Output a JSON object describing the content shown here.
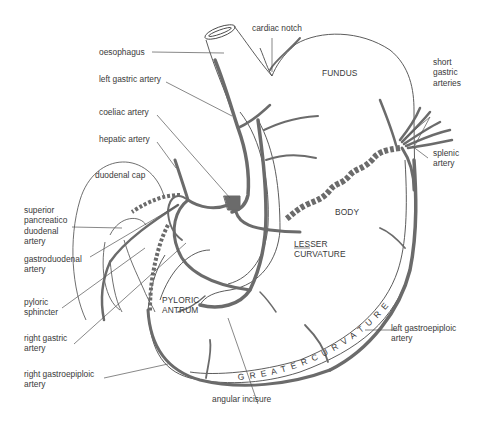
{
  "figure": {
    "colors": {
      "artery": "#6b6b6b",
      "outline": "#4a4a4a",
      "leader": "#555555",
      "text": "#3a3a3a",
      "background": "#ffffff"
    }
  },
  "labels": {
    "cardiac_notch": "cardiac notch",
    "oesophagus": "oesophagus",
    "left_gastric_artery": "left gastric artery",
    "coeliac_artery": "coeliac artery",
    "hepatic_artery": "hepatic artery",
    "duodenal_cap": "duodenal cap",
    "superior_pancreatico_duodenal_artery": "superior\npancreatico\nduodenal\nartery",
    "gastroduodenal_artery": "gastroduodenal\nartery",
    "pyloric_sphincter": "pyloric\nsphincter",
    "right_gastric_artery": "right gastric\nartery",
    "right_gastroepiploic_artery": "right gastroepiploic\nartery",
    "angular_incisure": "angular incisure",
    "left_gastroepiploic_artery": "left gastroepiploic\nartery",
    "splenic_artery": "splenic\nartery",
    "short_gastric_arteries": "short\ngastric\narteries"
  },
  "regions": {
    "fundus": "FUNDUS",
    "body": "BODY",
    "lesser_curvature": "LESSER\nCURVATURE",
    "pyloric_antrum": "PYLORIC\nANTRUM",
    "greater_curvature": "G R E A T E R     C U R V A T U R E"
  }
}
